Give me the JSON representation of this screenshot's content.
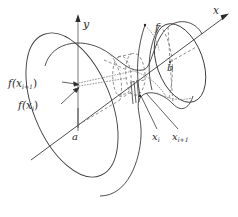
{
  "figure": {
    "kind": "solid-of-revolution-shell-diagram",
    "background_color": "#ffffff",
    "stroke_color": "#3a3a3a",
    "label_color": "#2b2b2b"
  },
  "axes": {
    "x_axis": {
      "label": "x",
      "direction": "up-right",
      "arrow": "arrowhead-right"
    },
    "y_axis": {
      "label": "y",
      "direction": "up",
      "arrow": "arrowhead-up"
    }
  },
  "labels": {
    "curve": "f",
    "lower_bound": "a",
    "upper_bound": "b",
    "value_lower": "f(x",
    "value_lower_sub": "i",
    "value_lower_close": ")",
    "value_upper": "f(x",
    "value_upper_sub": "i+1",
    "value_upper_close": ")",
    "sample_lower": "x",
    "sample_lower_sub": "i",
    "sample_upper": "x",
    "sample_upper_sub": "i+1"
  },
  "annotations": {
    "f_label": "f",
    "a_label": "a",
    "b_label": "b",
    "x_label": "x",
    "y_label": "y"
  }
}
